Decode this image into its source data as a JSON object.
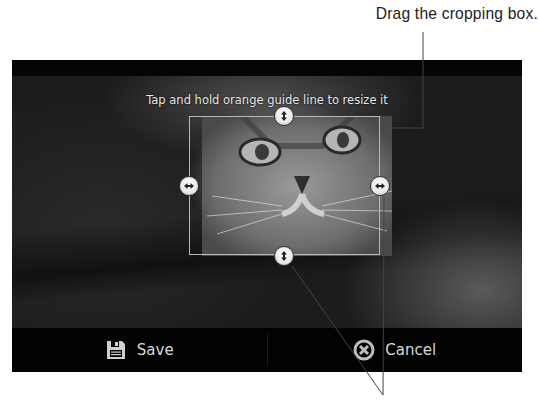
{
  "callouts": {
    "top": "Drag the cropping box.",
    "bottom": ""
  },
  "screen": {
    "hint": "Tap and hold orange guide line to resize it",
    "crop_box": {
      "x": 177,
      "y": 56,
      "width": 191,
      "height": 139
    },
    "handles": [
      {
        "name": "top",
        "icon": "vertical-resize-icon"
      },
      {
        "name": "left",
        "icon": "horizontal-resize-icon"
      },
      {
        "name": "right",
        "icon": "horizontal-resize-icon"
      },
      {
        "name": "bottom",
        "icon": "vertical-resize-icon"
      }
    ],
    "bottom_bar": {
      "save": {
        "label": "Save",
        "icon": "floppy-disk-icon"
      },
      "cancel": {
        "label": "Cancel",
        "icon": "cancel-x-circle-icon"
      }
    }
  },
  "colors": {
    "bar_bg": "#020202",
    "text_light": "#d8d8d8",
    "crop_border": "#b8b8b8",
    "callout_text": "#222222"
  }
}
